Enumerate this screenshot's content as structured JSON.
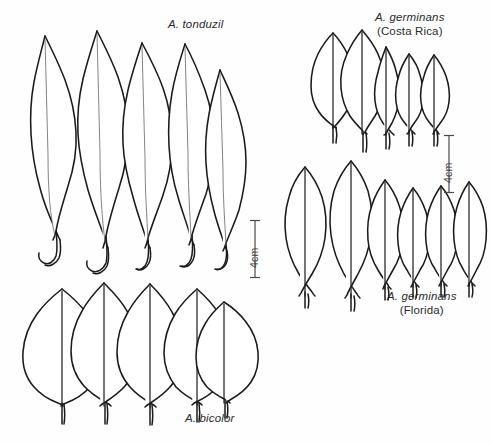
{
  "figure": {
    "type": "botanical-line-drawing",
    "background_color": "#fefefe",
    "ink_color": "#1a1a1a",
    "midrib_color": "#6d6d6d"
  },
  "groups": [
    {
      "id": "tonduzil",
      "species_label": "A. tonduzil",
      "locality_label": "",
      "leaf_count": 5,
      "leaf_shape": "narrow-lanceolate",
      "petiole_style": "long-curved-hook",
      "label_position": "top-center"
    },
    {
      "id": "germinans-costa-rica",
      "species_label": "A. germinans",
      "locality_label": "(Costa Rica)",
      "leaf_count": 5,
      "leaf_shape": "elliptic-to-oblanceolate",
      "petiole_style": "straight-narrow",
      "label_position": "top-right"
    },
    {
      "id": "germinans-florida",
      "species_label": "A. germinans",
      "locality_label": "(Florida)",
      "leaf_count": 6,
      "leaf_shape": "broad-elliptic",
      "petiole_style": "short-straight",
      "label_position": "bottom-right"
    },
    {
      "id": "bicolor",
      "species_label": "A. bicolor",
      "locality_label": "",
      "leaf_count": 5,
      "leaf_shape": "broad-ovate",
      "petiole_style": "short-straight",
      "label_position": "bottom-center"
    }
  ],
  "scale_bars": [
    {
      "id": "scale-left",
      "caption": "4cm",
      "orientation": "vertical",
      "caption_rotation": "-90deg"
    },
    {
      "id": "scale-right",
      "caption": "4cm",
      "orientation": "vertical",
      "caption_rotation": "-90deg"
    }
  ]
}
